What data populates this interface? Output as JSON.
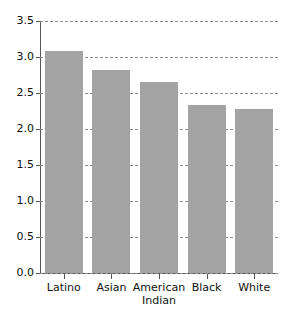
{
  "chart_data": {
    "type": "bar",
    "title": "",
    "subtitle": "",
    "xlabel": "",
    "ylabel": "",
    "categories": [
      "Latino",
      "Asian",
      "American\nIndian",
      "Black",
      "White"
    ],
    "values": [
      3.08,
      2.82,
      2.65,
      2.34,
      2.28
    ],
    "series": [
      {
        "name": "",
        "values": [
          3.08,
          2.82,
          2.65,
          2.34,
          2.28
        ]
      }
    ],
    "ylim": [
      0.0,
      3.5
    ],
    "y_ticks": [
      0.0,
      0.5,
      1.0,
      1.5,
      2.0,
      2.5,
      3.0,
      3.5
    ],
    "y_tick_labels": [
      "0.0",
      "0.5",
      "1.0",
      "1.5",
      "2.0",
      "2.5",
      "3.0",
      "3.5"
    ],
    "grid": true,
    "grid_axis": "y",
    "grid_style": "dashed",
    "legend": false,
    "legend_position": "none",
    "bar_color": "#a3a3a3",
    "grid_color": "#8d8d8d",
    "axis_color": "#555555",
    "background_color": "#ffffff",
    "annotations": []
  }
}
